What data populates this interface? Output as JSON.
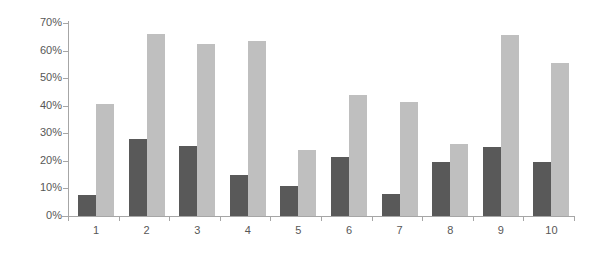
{
  "chart_data": {
    "type": "bar",
    "title": "",
    "subtitle": "",
    "xlabel": "",
    "ylabel": "",
    "categories": [
      "1",
      "2",
      "3",
      "4",
      "5",
      "6",
      "7",
      "8",
      "9",
      "10"
    ],
    "series": [
      {
        "name": "Series 1",
        "color": "#595959",
        "values": [
          7.5,
          28,
          25.5,
          15,
          11,
          21.5,
          8,
          19.5,
          25,
          19.5
        ]
      },
      {
        "name": "Series 2",
        "color": "#bfbfbf",
        "values": [
          40.5,
          66,
          62.5,
          63.5,
          24,
          44,
          41.5,
          26,
          65.5,
          55.5
        ]
      }
    ],
    "ylim": [
      0,
      70
    ],
    "ytick_values": [
      0,
      10,
      20,
      30,
      40,
      50,
      60,
      70
    ],
    "ytick_labels": [
      "0%",
      "10%",
      "20%",
      "30%",
      "40%",
      "50%",
      "60%",
      "70%"
    ],
    "grid": false,
    "legend": "none",
    "value_format": "percent",
    "axis_color": "#a6a6a6",
    "tick_label_color": "#575757",
    "background_color": "#ffffff"
  }
}
